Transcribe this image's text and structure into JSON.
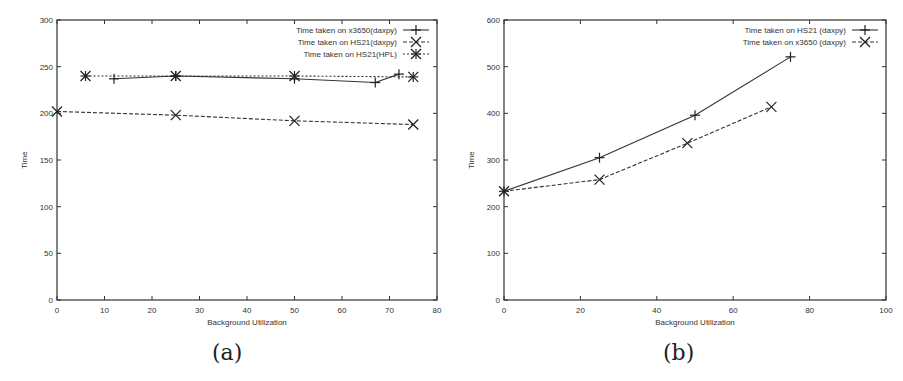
{
  "chart_data": [
    {
      "id": "a",
      "type": "line",
      "caption": "(a)",
      "title": "",
      "xlabel": "Background Utilization",
      "ylabel": "Time",
      "xlim": [
        0,
        80
      ],
      "ylim": [
        0,
        300
      ],
      "xticks": [
        0,
        10,
        20,
        30,
        40,
        50,
        60,
        70,
        80
      ],
      "yticks": [
        0,
        50,
        100,
        150,
        200,
        250,
        300
      ],
      "grid": false,
      "legend_position": "top-right",
      "series": [
        {
          "name": "Time taken on x3650(daxpy)",
          "marker": "plus",
          "line": "solid",
          "x": [
            12,
            25,
            50,
            67,
            72
          ],
          "y": [
            237,
            240,
            237,
            233,
            242
          ]
        },
        {
          "name": "Time taken on HS21(daxpy)",
          "marker": "x",
          "line": "dashed",
          "x": [
            0,
            25,
            50,
            75
          ],
          "y": [
            202,
            198,
            192,
            188
          ]
        },
        {
          "name": "Time taken on HS21(HPL)",
          "marker": "asterisk",
          "line": "dotted",
          "x": [
            6,
            25,
            50,
            75
          ],
          "y": [
            240,
            240,
            240,
            239
          ]
        }
      ]
    },
    {
      "id": "b",
      "type": "line",
      "caption": "(b)",
      "title": "",
      "xlabel": "Background Utilization",
      "ylabel": "Time",
      "xlim": [
        0,
        100
      ],
      "ylim": [
        0,
        600
      ],
      "xticks": [
        0,
        20,
        40,
        60,
        80,
        100
      ],
      "yticks": [
        0,
        100,
        200,
        300,
        400,
        500,
        600
      ],
      "grid": false,
      "legend_position": "top-right",
      "series": [
        {
          "name": "Time taken on HS21 (daxpy)",
          "marker": "plus",
          "line": "solid",
          "x": [
            0,
            25,
            50,
            75
          ],
          "y": [
            233,
            305,
            396,
            521
          ]
        },
        {
          "name": "Time taken on x3650 (daxpy)",
          "marker": "x",
          "line": "dashed",
          "x": [
            0,
            25,
            48,
            70
          ],
          "y": [
            233,
            258,
            336,
            414
          ]
        }
      ]
    }
  ]
}
